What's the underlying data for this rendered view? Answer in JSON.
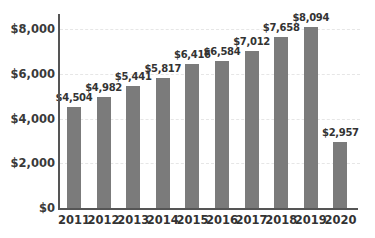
{
  "chart_data": {
    "type": "bar",
    "title": "",
    "xlabel": "",
    "ylabel": "",
    "categories": [
      "2011",
      "2012",
      "2013",
      "2014",
      "2015",
      "2016",
      "2017",
      "2018",
      "2019",
      "2020"
    ],
    "values": [
      4504,
      4982,
      5441,
      5817,
      6416,
      6584,
      7012,
      7658,
      8094,
      2957
    ],
    "data_labels": [
      "$4,504",
      "$4,982",
      "$5,441",
      "$5,817",
      "$6,416",
      "$6,584",
      "$7,012",
      "$7,658",
      "$8,094",
      "$2,957"
    ],
    "ylim": [
      0,
      8000
    ],
    "yticks": [
      0,
      2000,
      4000,
      6000,
      8000
    ],
    "ytick_labels": [
      "$0",
      "$2,000",
      "$4,000",
      "$6,000",
      "$8,000"
    ],
    "grid": true,
    "legend": null,
    "bar_color": "#7b7b7b"
  }
}
